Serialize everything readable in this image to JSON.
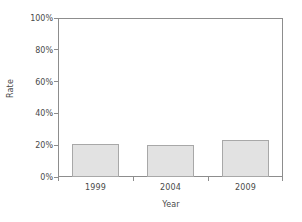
{
  "chart_data": {
    "type": "bar",
    "title": "",
    "categories": [
      "1999",
      "2004",
      "2009"
    ],
    "values": [
      20.5,
      20.0,
      23.5
    ],
    "series": [
      {
        "name": "Rate",
        "values": [
          20.5,
          20.0,
          23.5
        ]
      }
    ],
    "xlabel": "Year",
    "ylabel": "Rate",
    "ylim": [
      0,
      100
    ],
    "yticks": [
      0,
      20,
      40,
      60,
      80,
      100
    ],
    "ytick_labels": [
      "0%",
      "20%",
      "40%",
      "60%",
      "80%",
      "100%"
    ],
    "xtick_labels": [
      "1999",
      "2004",
      "2009"
    ],
    "grid": false,
    "legend": null,
    "bar_fill_color": "#e2e2e2",
    "bar_border_color": "#a8a8a8",
    "axis_color": "#8d8d8d",
    "text_color": "#4a4a4a",
    "background_color": "#ffffff"
  }
}
